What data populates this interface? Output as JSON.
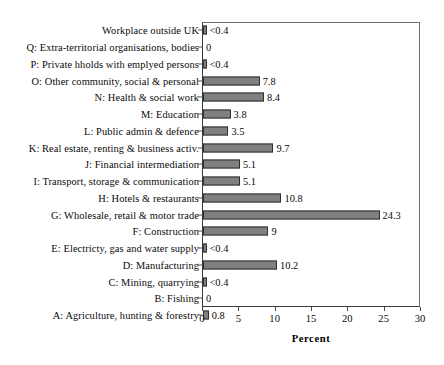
{
  "chart_data": {
    "type": "bar",
    "orientation": "horizontal",
    "title": "",
    "xlabel": "Percent",
    "ylabel": "",
    "xlim": [
      0,
      30
    ],
    "xticks": [
      0,
      5,
      10,
      15,
      20,
      25,
      30
    ],
    "grid": false,
    "legend": false,
    "categories": [
      "Workplace outside UK",
      "Q: Extra-territorial organisations, bodies",
      "P: Private hholds with emplyed persons",
      "O: Other community, social & personal",
      "N: Health & social work",
      "M: Education",
      "L: Public admin & defence",
      "K: Real estate, renting & business activ.",
      "J: Financial intermediation",
      "I: Transport, storage & communication",
      "H: Hotels & restaurants",
      "G: Wholesale, retail & motor trade",
      "F: Construction",
      "E: Electricty, gas and water supply",
      "D: Manufacturing",
      "C: Mining, quarrying",
      "B: Fishing",
      "A: Agriculture, hunting & forestry"
    ],
    "values": [
      0.3,
      0,
      0.3,
      7.8,
      8.4,
      3.8,
      3.5,
      9.7,
      5.1,
      5.1,
      10.8,
      24.3,
      9,
      0.3,
      10.2,
      0.3,
      0,
      0.8
    ],
    "value_labels": [
      "<0.4",
      "0",
      "<0.4",
      "7.8",
      "8.4",
      "3.8",
      "3.5",
      "9.7",
      "5.1",
      "5.1",
      "10.8",
      "24.3",
      "9",
      "<0.4",
      "10.2",
      "<0.4",
      "0",
      "0.8"
    ],
    "bar_color": "#808080",
    "bar_outline_color": "#2e2e2e",
    "axis_color": "#3a3a3a",
    "text_color": "#0a0a0a"
  }
}
